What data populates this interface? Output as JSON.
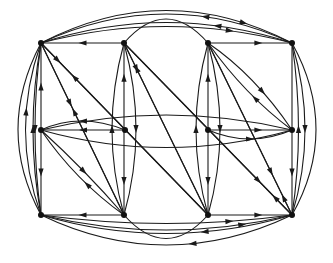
{
  "diagram": {
    "type": "directed-graph",
    "layout": "3x4 grid",
    "colors": {
      "edge": "#1a1a1a",
      "node": "#111111",
      "background": "#ffffff"
    },
    "nodes": [
      {
        "id": "a1",
        "x": 41,
        "y": 43
      },
      {
        "id": "a2",
        "x": 124,
        "y": 43
      },
      {
        "id": "a3",
        "x": 208,
        "y": 43
      },
      {
        "id": "a4",
        "x": 292,
        "y": 43
      },
      {
        "id": "b1",
        "x": 41,
        "y": 130
      },
      {
        "id": "b2",
        "x": 125,
        "y": 130
      },
      {
        "id": "b3",
        "x": 208,
        "y": 130
      },
      {
        "id": "b4",
        "x": 292,
        "y": 130
      },
      {
        "id": "c1",
        "x": 41,
        "y": 215
      },
      {
        "id": "c2",
        "x": 124,
        "y": 215
      },
      {
        "id": "c3",
        "x": 208,
        "y": 215
      },
      {
        "id": "c4",
        "x": 292,
        "y": 215
      }
    ],
    "edges": [
      {
        "d": "M124,43 L41,43",
        "m": 0.5
      },
      {
        "d": "M208,43 L292,43",
        "m": 0.6
      },
      {
        "d": "M124,43 Q166,-5 208,43",
        "m": -1
      },
      {
        "d": "M292,43 Q166,2 41,43",
        "m": 0.3
      },
      {
        "d": "M41,43 Q166,10 292,43",
        "m": 0.75
      },
      {
        "d": "M292,43 Q166,-15 41,43",
        "m": 0.35
      },
      {
        "d": "M41,43 Q166,-22 292,43",
        "m": 0.8
      },
      {
        "d": "M124,215 L41,215",
        "m": 0.5
      },
      {
        "d": "M208,215 L292,215",
        "m": 0.6
      },
      {
        "d": "M124,215 Q166,262 208,215",
        "m": -1
      },
      {
        "d": "M292,215 Q166,252 41,215",
        "m": 0.35
      },
      {
        "d": "M41,215 Q166,245 292,215",
        "m": 0.8
      },
      {
        "d": "M41,215 Q166,232 292,215",
        "m": 0.75
      },
      {
        "d": "M292,215 Q166,275 41,215",
        "m": 0.4
      },
      {
        "d": "M125,130 L41,130",
        "m": 0.5
      },
      {
        "d": "M125,130 Q80,112 41,130",
        "m": 0.5
      },
      {
        "d": "M208,130 L292,130",
        "m": 0.6
      },
      {
        "d": "M208,130 Q250,148 292,130",
        "m": 0.5
      },
      {
        "d": "M41,130 Q166,100 292,130",
        "m": -1
      },
      {
        "d": "M41,130 Q166,165 292,130",
        "m": -1
      },
      {
        "d": "M41,130 L41,43",
        "m": 0.5
      },
      {
        "d": "M41,130 L41,215",
        "m": 0.5
      },
      {
        "d": "M41,215 Q25,130 41,43",
        "m": 0.5
      },
      {
        "d": "M41,43 Q29,130 41,215",
        "m": 0.5
      },
      {
        "d": "M41,215 Q10,130 41,43",
        "m": 0.6
      },
      {
        "d": "M41,43 Q-5,130 41,215",
        "m": -1
      },
      {
        "d": "M292,130 L292,43",
        "m": -1
      },
      {
        "d": "M292,130 L292,215",
        "m": 0.5
      },
      {
        "d": "M292,215 Q305,130 292,43",
        "m": 0.5
      },
      {
        "d": "M292,43 Q318,130 292,215",
        "m": 0.5
      },
      {
        "d": "M292,215 Q340,130 292,43",
        "m": -1
      },
      {
        "d": "M124,130 L124,43",
        "m": 0.6
      },
      {
        "d": "M124,130 L124,215",
        "m": 0.6
      },
      {
        "d": "M124,215 Q100,130 124,43",
        "m": 0.5
      },
      {
        "d": "M124,43 Q148,130 124,215",
        "m": 0.5
      },
      {
        "d": "M208,130 L208,43",
        "m": 0.6
      },
      {
        "d": "M208,130 L208,215",
        "m": 0.6
      },
      {
        "d": "M208,215 Q184,130 208,43",
        "m": 0.5
      },
      {
        "d": "M208,43 Q232,130 208,215",
        "m": 0.5
      },
      {
        "d": "M124,215 L41,43",
        "m": 0.6
      },
      {
        "d": "M41,43 L124,215",
        "m": 0.35
      },
      {
        "d": "M208,215 L41,43",
        "m": 0.8
      },
      {
        "d": "M41,43 L208,215",
        "m": 0.1
      },
      {
        "d": "M124,43 L292,215",
        "m": 0.8
      },
      {
        "d": "M292,215 L124,43",
        "m": 0.1
      },
      {
        "d": "M124,43 L208,215",
        "m": 0.15
      },
      {
        "d": "M208,215 L124,43",
        "m": 0.85
      },
      {
        "d": "M292,215 L208,43",
        "m": 0.1
      },
      {
        "d": "M208,43 L292,215",
        "m": 0.75
      },
      {
        "d": "M41,130 Q85,170 124,215",
        "m": 0.5
      },
      {
        "d": "M124,215 Q75,180 41,130",
        "m": 0.4
      },
      {
        "d": "M208,43 Q255,75 292,130",
        "m": 0.6
      },
      {
        "d": "M292,130 Q245,95 208,43",
        "m": 0.4
      }
    ]
  }
}
